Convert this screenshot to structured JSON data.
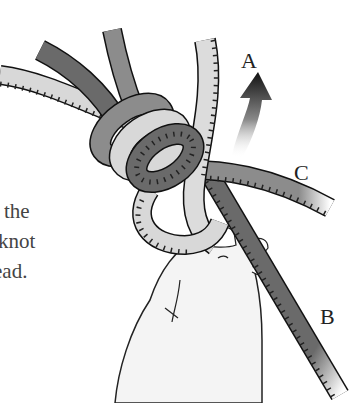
{
  "figure": {
    "caption_lines": [
      "the",
      "knot",
      "read."
    ],
    "labels": {
      "a": "A",
      "b": "B",
      "c": "C"
    },
    "arrow": {
      "direction": "up",
      "target_label": "A"
    },
    "colors": {
      "rope_dark": "#6a6a6a",
      "rope_mid": "#8c8c8c",
      "rope_light": "#d8d8d8",
      "outline": "#1a1a1a",
      "arrow": "#111111",
      "text": "#444444"
    }
  }
}
